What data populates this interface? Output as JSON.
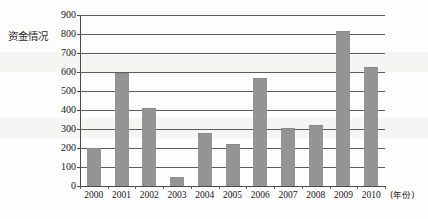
{
  "chart_data": {
    "type": "bar",
    "title": "",
    "ylabel": "资金情况",
    "xlabel": "(年份)",
    "categories": [
      "2000",
      "2001",
      "2002",
      "2003",
      "2004",
      "2005",
      "2006",
      "2007",
      "2008",
      "2009",
      "2010"
    ],
    "values": [
      200,
      595,
      412,
      48,
      277,
      222,
      568,
      305,
      322,
      818,
      625
    ],
    "series": [
      {
        "name": "资金情况",
        "values": [
          200,
          595,
          412,
          48,
          277,
          222,
          568,
          305,
          322,
          818,
          625
        ]
      }
    ],
    "ylim": [
      0,
      900
    ],
    "yticks": [
      "0",
      "100",
      "200",
      "300",
      "400",
      "500",
      "600",
      "700",
      "800",
      "900"
    ],
    "ytick_values": [
      0,
      100,
      200,
      300,
      400,
      500,
      600,
      700,
      800,
      900
    ],
    "grid": true,
    "legend": false,
    "legend_position": "none",
    "bar_color": "#949494",
    "axis_color": "#4a4a4a",
    "gridline_color": "#5d5d5d",
    "background_color": "#fdfdfd"
  }
}
